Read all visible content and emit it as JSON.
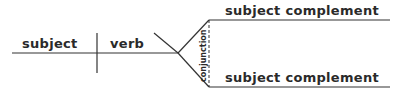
{
  "diagram": {
    "type": "sentence-diagram",
    "labels": {
      "subject": "subject",
      "verb": "verb",
      "conjunction": "conjunction",
      "complement_top": "subject complement",
      "complement_bottom": "subject complement"
    },
    "colors": {
      "line": "#333333",
      "text": "#2a2a2a",
      "background": "#ffffff"
    }
  }
}
